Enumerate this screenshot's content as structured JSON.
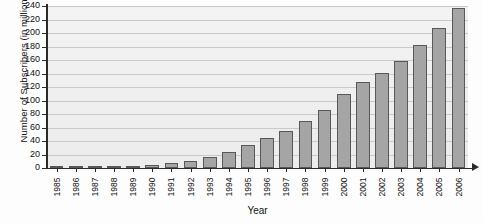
{
  "chart_data": {
    "type": "bar",
    "title": "",
    "xlabel": "Year",
    "ylabel": "Number of Subscribers (in millions)",
    "ylim": [
      0,
      240
    ],
    "ytick_step": 20,
    "yticks": [
      240,
      220,
      200,
      180,
      160,
      140,
      120,
      100,
      80,
      60,
      40,
      20,
      0
    ],
    "grid": true,
    "legend": "none",
    "bar_color": "#a5a5a5",
    "bar_edge_color": "#585858",
    "plot_background": "#eeeeee",
    "categories": [
      "1985",
      "1986",
      "1987",
      "1988",
      "1989",
      "1990",
      "1991",
      "1992",
      "1993",
      "1994",
      "1995",
      "1996",
      "1997",
      "1998",
      "1999",
      "2000",
      "2001",
      "2002",
      "2003",
      "2004",
      "2005",
      "2006"
    ],
    "values": [
      0.3,
      0.7,
      1.2,
      2,
      3.5,
      5,
      7.5,
      11,
      16,
      24,
      34,
      44,
      55,
      69,
      86,
      110,
      128,
      141,
      159,
      182,
      208,
      237
    ],
    "series": [
      {
        "name": "Number of Subscribers (in millions)",
        "values": [
          0.3,
          0.7,
          1.2,
          2,
          3.5,
          5,
          7.5,
          11,
          16,
          24,
          34,
          44,
          55,
          69,
          86,
          110,
          128,
          141,
          159,
          182,
          208,
          237
        ]
      }
    ]
  }
}
